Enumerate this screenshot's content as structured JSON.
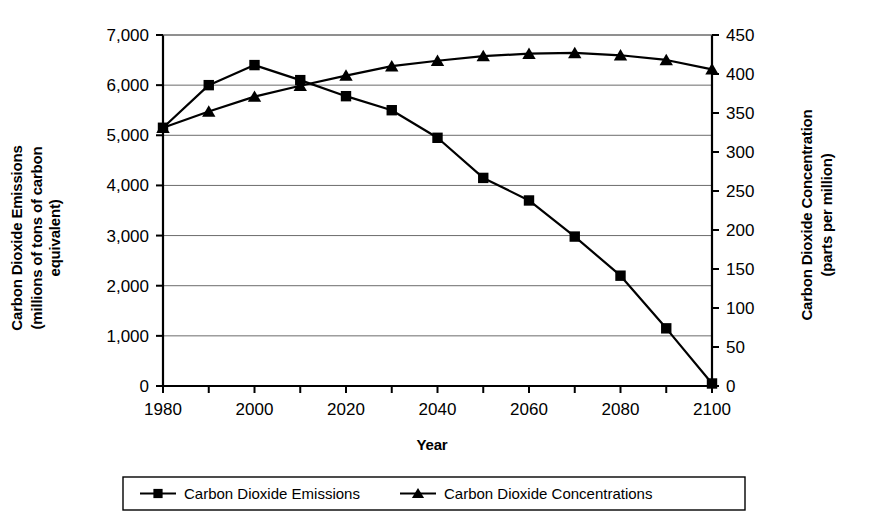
{
  "chart_data": {
    "type": "line",
    "title": "",
    "xlabel": "Year",
    "ylabel": "Carbon Dioxide Emissions (millions of tons of carbon equivalent)",
    "y2label": "Carbon Dioxide Concentration (parts per million)",
    "x": [
      1980,
      1990,
      2000,
      2010,
      2020,
      2030,
      2040,
      2050,
      2060,
      2070,
      2080,
      2090,
      2100
    ],
    "xlim": [
      1980,
      2100
    ],
    "ylim": [
      0,
      7000
    ],
    "y2lim": [
      0,
      450
    ],
    "grid": true,
    "legend_position": "bottom",
    "series": [
      {
        "name": "Carbon Dioxide Emissions",
        "axis": "left",
        "marker": "square",
        "values": [
          5150,
          6000,
          6400,
          6100,
          5780,
          5500,
          4950,
          4150,
          3700,
          2980,
          2200,
          1150,
          50
        ]
      },
      {
        "name": "Carbon Dioxide Concentrations",
        "axis": "right",
        "marker": "triangle",
        "values": [
          331,
          352,
          371,
          385,
          398,
          410,
          417,
          423,
          426,
          427,
          424,
          418,
          406
        ]
      }
    ]
  },
  "axes": {
    "left_title_line1": "Carbon Dioxide Emissions",
    "left_title_line2": "(millions of tons of carbon",
    "left_title_line3": "equivalent)",
    "right_title_line1": "Carbon Dioxide Concentration",
    "right_title_line2": "(parts per million)",
    "x_title": "Year",
    "left_ticks": [
      "7,000",
      "6,000",
      "5,000",
      "4,000",
      "3,000",
      "2,000",
      "1,000",
      "0"
    ],
    "left_tick_values": [
      7000,
      6000,
      5000,
      4000,
      3000,
      2000,
      1000,
      0
    ],
    "right_ticks": [
      "450",
      "400",
      "350",
      "300",
      "250",
      "200",
      "150",
      "100",
      "50",
      "0"
    ],
    "right_tick_values": [
      450,
      400,
      350,
      300,
      250,
      200,
      150,
      100,
      50,
      0
    ],
    "x_ticks": [
      "1980",
      "2000",
      "2020",
      "2040",
      "2060",
      "2080",
      "2100"
    ],
    "x_tick_values": [
      1980,
      2000,
      2020,
      2040,
      2060,
      2080,
      2100
    ],
    "x_minor_values": [
      1990,
      2010,
      2030,
      2050,
      2070,
      2090
    ]
  },
  "legend": {
    "items": [
      {
        "label": "Carbon Dioxide Emissions",
        "marker": "square"
      },
      {
        "label": "Carbon Dioxide Concentrations",
        "marker": "triangle"
      }
    ]
  },
  "colors": {
    "ink": "#000000",
    "grid": "#6b6b6b",
    "background": "#ffffff"
  }
}
